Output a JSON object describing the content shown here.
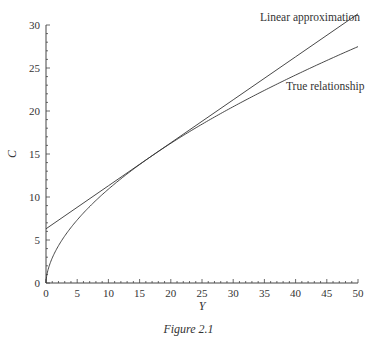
{
  "figure": {
    "caption": "Figure 2.1"
  },
  "chart_data": {
    "type": "line",
    "title": "",
    "xlabel": "Y",
    "ylabel": "C",
    "xlim": [
      0,
      50
    ],
    "ylim": [
      0,
      30
    ],
    "xticks": [
      0,
      5,
      10,
      15,
      20,
      25,
      30,
      35,
      40,
      45,
      50
    ],
    "yticks": [
      0,
      5,
      10,
      15,
      20,
      25,
      30
    ],
    "minor_tick_step": 1,
    "grid": false,
    "legend": "inline annotations at right end of curves",
    "series": [
      {
        "name": "Linear approximation",
        "label_text": "Linear approximation",
        "x": [
          0,
          10,
          20,
          30,
          40,
          50
        ],
        "y": [
          6.3,
          11.3,
          16.3,
          21.3,
          26.3,
          31.3
        ]
      },
      {
        "name": "True relationship",
        "label_text": "True relationship",
        "x": [
          0,
          1,
          2.5,
          5,
          10,
          15,
          20,
          25,
          30,
          35,
          40,
          45,
          50
        ],
        "y": [
          0,
          2.9,
          4.9,
          7.3,
          10.9,
          13.6,
          16.0,
          18.1,
          20.1,
          21.9,
          24.2,
          25.6,
          27.1
        ]
      }
    ]
  }
}
